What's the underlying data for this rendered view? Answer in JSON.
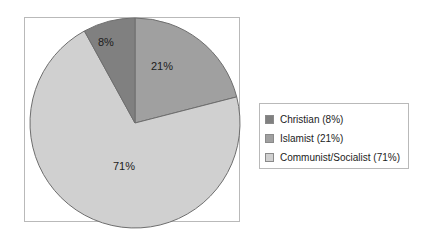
{
  "chart_data": {
    "type": "pie",
    "title": "",
    "categories": [
      "Christian",
      "Islamist",
      "Communist/Socialist"
    ],
    "values": [
      8,
      21,
      71
    ],
    "value_unit": "%",
    "data_labels": [
      "8%",
      "21%",
      "71%"
    ],
    "colors": [
      "#808080",
      "#a0a0a0",
      "#d0d0d0"
    ],
    "legend_position": "right",
    "legend_entries": [
      "Christian (8%)",
      "Islamist (21%)",
      "Communist/Socialist (71%)"
    ],
    "slices": [
      {
        "name": "Islamist",
        "label": "21%",
        "value": 21,
        "color": "#a0a0a0",
        "start_angle_deg": 0,
        "end_angle_deg": 75.6
      },
      {
        "name": "Communist/Socialist",
        "label": "71%",
        "value": 71,
        "color": "#d0d0d0",
        "start_angle_deg": 75.6,
        "end_angle_deg": 331.2
      },
      {
        "name": "Christian",
        "label": "8%",
        "value": 8,
        "color": "#808080",
        "start_angle_deg": 331.2,
        "end_angle_deg": 360
      }
    ],
    "grid": false,
    "xlabel": "",
    "ylabel": ""
  },
  "legend": {
    "items": [
      {
        "label": "Christian (8%)",
        "color": "#808080"
      },
      {
        "label": "Islamist (21%)",
        "color": "#a0a0a0"
      },
      {
        "label": "Communist/Socialist (71%)",
        "color": "#d0d0d0"
      }
    ]
  },
  "style": {
    "background": "#ffffff",
    "border_color": "#b9b9b9",
    "slice_outline": "#6e6e6e",
    "text_color": "#1c1c1c"
  }
}
